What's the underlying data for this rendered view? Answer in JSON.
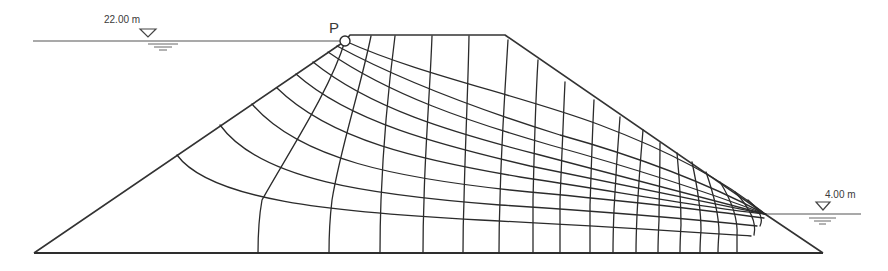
{
  "figure": {
    "point_label": "P",
    "upstream": {
      "level_label": "22.00 m",
      "level_value_m": 22.0
    },
    "downstream": {
      "level_label": "4.00 m",
      "level_value_m": 4.0
    }
  },
  "geometry": {
    "base": {
      "x1": 34,
      "x2": 823,
      "y": 253
    },
    "crest": {
      "x1": 345,
      "x2": 505,
      "y": 35
    },
    "upstream_water_y": 41,
    "downstream_water_y": 214,
    "point_p": {
      "x": 345,
      "y": 41,
      "r": 5
    },
    "toe_exit": {
      "x": 765,
      "y": 214
    }
  },
  "colors": {
    "line": "#2b2b2b",
    "background": "#ffffff",
    "text": "#3a3a3a"
  }
}
